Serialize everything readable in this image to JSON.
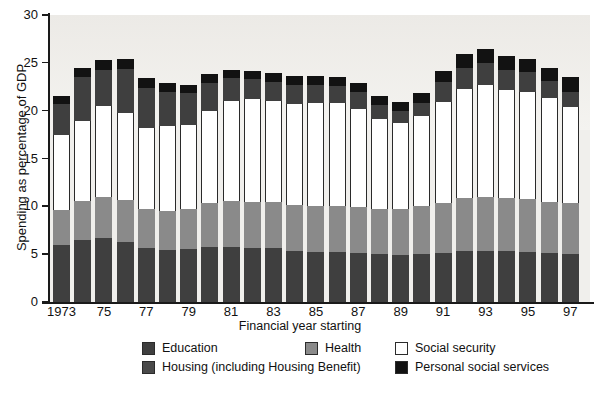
{
  "chart_data": {
    "type": "bar",
    "stacked": true,
    "title": "",
    "xlabel": "Financial year starting",
    "ylabel": "Spending as percentage of GDP",
    "ylim": [
      0,
      30
    ],
    "yticks": [
      0,
      5,
      10,
      15,
      20,
      25,
      30
    ],
    "grid": false,
    "legend_position": "bottom",
    "categories": [
      "1973",
      "1974",
      "1975",
      "1976",
      "1977",
      "1978",
      "1979",
      "1980",
      "1981",
      "1982",
      "1983",
      "1984",
      "1985",
      "1986",
      "1987",
      "1988",
      "1989",
      "1990",
      "1991",
      "1992",
      "1993",
      "1994",
      "1995",
      "1996",
      "1997"
    ],
    "tick_labels": [
      "1973",
      "",
      "75",
      "",
      "77",
      "",
      "79",
      "",
      "81",
      "",
      "83",
      "",
      "85",
      "",
      "87",
      "",
      "89",
      "",
      "91",
      "",
      "93",
      "",
      "95",
      "",
      "97"
    ],
    "series": [
      {
        "name": "Education",
        "color": "#3f3f3f",
        "values": [
          6.0,
          6.5,
          6.7,
          6.3,
          5.6,
          5.4,
          5.5,
          5.8,
          5.7,
          5.6,
          5.6,
          5.3,
          5.2,
          5.2,
          5.1,
          5.0,
          4.9,
          5.0,
          5.1,
          5.3,
          5.3,
          5.3,
          5.2,
          5.1,
          5.0
        ]
      },
      {
        "name": "Health",
        "color": "#8a8a8a",
        "values": [
          3.6,
          4.1,
          4.3,
          4.4,
          4.1,
          4.1,
          4.2,
          4.6,
          4.9,
          4.9,
          4.9,
          4.8,
          4.8,
          4.8,
          4.8,
          4.7,
          4.8,
          5.0,
          5.3,
          5.6,
          5.7,
          5.6,
          5.6,
          5.4,
          5.3
        ]
      },
      {
        "name": "Social security",
        "color": "#ffffff",
        "values": [
          7.9,
          8.3,
          9.5,
          9.1,
          8.5,
          8.9,
          8.8,
          9.6,
          10.4,
          10.7,
          10.5,
          10.6,
          10.8,
          10.8,
          10.3,
          9.4,
          9.0,
          9.4,
          10.5,
          11.4,
          11.7,
          11.3,
          11.2,
          10.8,
          10.1
        ]
      },
      {
        "name": "Housing (including Housing Benefit)",
        "color": "#3f3f3f",
        "values": [
          3.2,
          4.6,
          3.8,
          4.6,
          4.2,
          3.6,
          3.3,
          2.9,
          2.4,
          2.1,
          2.0,
          2.0,
          1.9,
          1.8,
          1.8,
          1.5,
          1.3,
          1.4,
          2.1,
          2.2,
          2.3,
          2.1,
          2.0,
          1.8,
          1.6
        ]
      },
      {
        "name": "Personal social services",
        "color": "#121212",
        "values": [
          0.8,
          1.0,
          1.0,
          1.0,
          1.0,
          0.9,
          0.9,
          0.9,
          0.9,
          0.9,
          0.9,
          0.9,
          0.9,
          0.9,
          0.9,
          0.9,
          0.9,
          1.0,
          1.2,
          1.4,
          1.4,
          1.4,
          1.4,
          1.4,
          1.5
        ]
      }
    ]
  },
  "axes": {
    "y_title": "Spending as percentage of GDP",
    "x_title": "Financial year starting",
    "y_tick_labels": [
      "0",
      "5",
      "10",
      "15",
      "20",
      "25",
      "30"
    ]
  },
  "legend": {
    "items": [
      {
        "key": "edu",
        "label": "Education"
      },
      {
        "key": "hea",
        "label": "Health"
      },
      {
        "key": "soc",
        "label": "Social security"
      },
      {
        "key": "hou",
        "label": "Housing (including Housing Benefit)"
      },
      {
        "key": "pss",
        "label": "Personal social services"
      }
    ]
  },
  "colors": {
    "education": "#3f3f3f",
    "health": "#8a8a8a",
    "social_security": "#ffffff",
    "housing": "#3f3f3f",
    "personal_social_services": "#121212",
    "plot_background": "#f0efec",
    "axis": "#1a1a1a"
  }
}
